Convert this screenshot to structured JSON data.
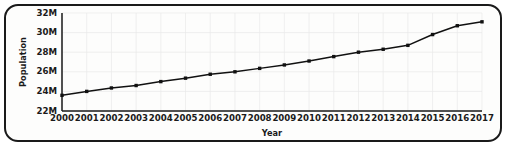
{
  "chart_data": {
    "type": "line",
    "title": "",
    "xlabel": "Year",
    "ylabel": "Population",
    "x": [
      2000,
      2001,
      2002,
      2003,
      2004,
      2005,
      2006,
      2007,
      2008,
      2009,
      2010,
      2011,
      2012,
      2013,
      2014,
      2015,
      2016,
      2017
    ],
    "xtick_labels": [
      "2000",
      "2001",
      "2002",
      "2003",
      "2004",
      "2005",
      "2006",
      "2007",
      "2008",
      "2009",
      "2010",
      "2011",
      "2012",
      "2013",
      "2014",
      "2015",
      "2016",
      "2017"
    ],
    "values": [
      23.6,
      24.0,
      24.35,
      24.6,
      25.0,
      25.35,
      25.75,
      26.0,
      26.35,
      26.7,
      27.1,
      27.55,
      28.0,
      28.3,
      28.7,
      29.8,
      30.7,
      31.1
    ],
    "value_unit": "millions",
    "ylim": [
      22,
      32
    ],
    "yticks": [
      22,
      24,
      26,
      28,
      30,
      32
    ],
    "ytick_labels": [
      "22M",
      "24M",
      "26M",
      "28M",
      "30M",
      "32M"
    ],
    "xlim": [
      2000,
      2017
    ],
    "grid": true,
    "legend": null,
    "legend_position": "none",
    "marker": "square",
    "series_color": "#111111",
    "grid_color": "#e9e9e9",
    "axis_color": "#1a1a1a"
  },
  "figure": {
    "border_color": "#1a1a1a",
    "background": "#fdfdfc"
  }
}
